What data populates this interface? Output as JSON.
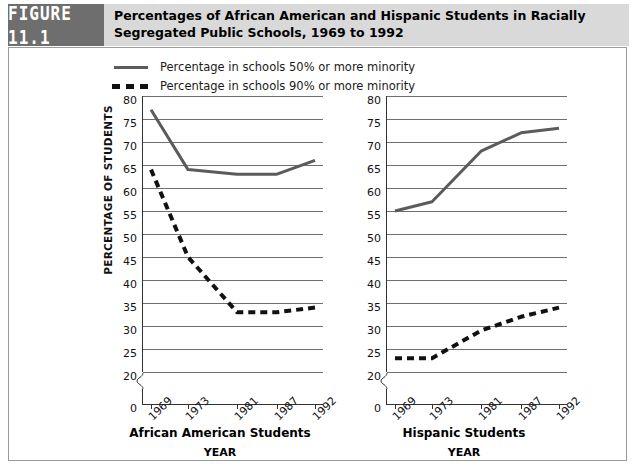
{
  "header": {
    "figure_label": "FIGURE 11.1",
    "title": "Percentages of African American and Hispanic Students in Racially Segregated Public Schools, 1969 to 1992"
  },
  "legend": {
    "items": [
      {
        "style": "solid",
        "label": "Percentage in schools 50% or more minority"
      },
      {
        "style": "dashed",
        "label": "Percentage in schools 90% or more minority"
      }
    ]
  },
  "axis": {
    "ylabel": "PERCENTAGE OF STUDENTS",
    "xlabel": "YEAR",
    "yticks": [
      "80",
      "75",
      "70",
      "65",
      "60",
      "55",
      "50",
      "45",
      "40",
      "35",
      "30",
      "25",
      "20"
    ],
    "yzero": "0",
    "xticks": [
      "1969",
      "1973",
      "1981",
      "1987",
      "1992"
    ]
  },
  "panels": [
    {
      "caption": "African American Students",
      "xlabel": "YEAR"
    },
    {
      "caption": "Hispanic Students",
      "xlabel": "YEAR"
    }
  ],
  "colors": {
    "solid_line": "#5b5b5b",
    "dashed_line": "#111111",
    "gridline": "#6f6f6f",
    "banner": "#d9d9d9",
    "badge": "#6e6e6e"
  },
  "chart_data": {
    "type": "line",
    "title": "Percentages of African American and Hispanic Students in Racially Segregated Public Schools, 1969 to 1992",
    "xlabel": "YEAR",
    "ylabel": "PERCENTAGE OF STUDENTS",
    "x": [
      1969,
      1973,
      1981,
      1987,
      1992
    ],
    "ylim": [
      20,
      80
    ],
    "ytick_step": 5,
    "grid": true,
    "axis_break": "y-axis broken between 0 and 20",
    "legend_position": "above-plot-left",
    "panels": [
      {
        "name": "African American Students",
        "series": [
          {
            "name": "Percentage in schools 50% or more minority",
            "style": "solid",
            "values": [
              77,
              64,
              63,
              63,
              66
            ]
          },
          {
            "name": "Percentage in schools 90% or more minority",
            "style": "dashed",
            "values": [
              64,
              45,
              33,
              33,
              34
            ]
          }
        ]
      },
      {
        "name": "Hispanic Students",
        "series": [
          {
            "name": "Percentage in schools 50% or more minority",
            "style": "solid",
            "values": [
              55,
              57,
              68,
              72,
              73
            ]
          },
          {
            "name": "Percentage in schools 90% or more minority",
            "style": "dashed",
            "values": [
              23,
              23,
              29,
              32,
              34
            ]
          }
        ]
      }
    ]
  }
}
